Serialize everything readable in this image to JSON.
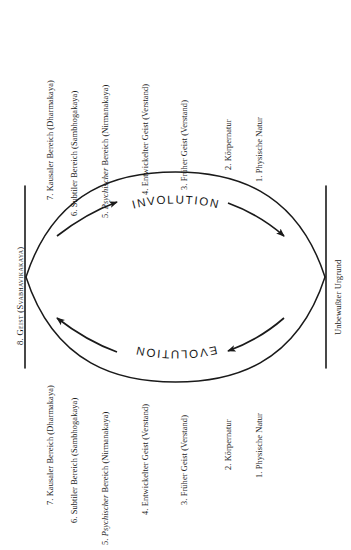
{
  "diagram": {
    "title_involution": "INVOLUTION",
    "title_evolution": "EVOLUTION",
    "left_bracket_label": "8. Geist (Svabhavikakaya)",
    "right_bracket_label": "Unbewußter Urgrund",
    "levels_top": [
      "7. Kausaler Bereich (Dharmakaya)",
      "6. Subtiler Bereich (Sambhogakaya)",
      "5. Psychischer Bereich (Nirmanakaya)",
      "4. Entwickelter Geist (Verstand)",
      "3. Früher Geist (Verstand)",
      "2. Körpernatur",
      "1. Physische Natur"
    ],
    "levels_bottom": [
      "7. Kausaler Bereich (Dharmakaya)",
      "6. Subtiler Bereich (Sambhogakaya)",
      "5. Psychischer Bereich (Nirmanakaya)",
      "4. Entwickelter Geist (Verstand)",
      "3. Früher Geist (Verstand)",
      "2. Körpernatur",
      "1. Physische Natur"
    ],
    "level_5_italic_word": "Psychischer",
    "level_5_prefix": "5. ",
    "level_5_suffix": " Bereich (Nirmanakaya)",
    "colors": {
      "ink": "#1a1a1a",
      "background": "#ffffff"
    }
  }
}
